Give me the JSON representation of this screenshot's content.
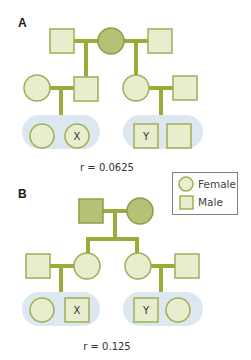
{
  "colors": {
    "line": "#9aab3a",
    "ancestor_fill": "#b5c174",
    "ancestor_stroke": "#8e9e45",
    "node_fill": "#e8edcd",
    "node_stroke": "#9fae55",
    "group_bg": "#dce7f0",
    "legend_border": "#8a8072"
  },
  "legend": {
    "female_label": "Female",
    "male_label": "Male"
  },
  "panels": [
    {
      "label": "A",
      "coefficient_text": "r = 0.0625",
      "group_left": {
        "marked_label": "X"
      },
      "group_right": {
        "marked_label": "Y"
      }
    },
    {
      "label": "B",
      "coefficient_text": "r = 0.125",
      "group_left": {
        "marked_label": "X"
      },
      "group_right": {
        "marked_label": "Y"
      }
    }
  ]
}
